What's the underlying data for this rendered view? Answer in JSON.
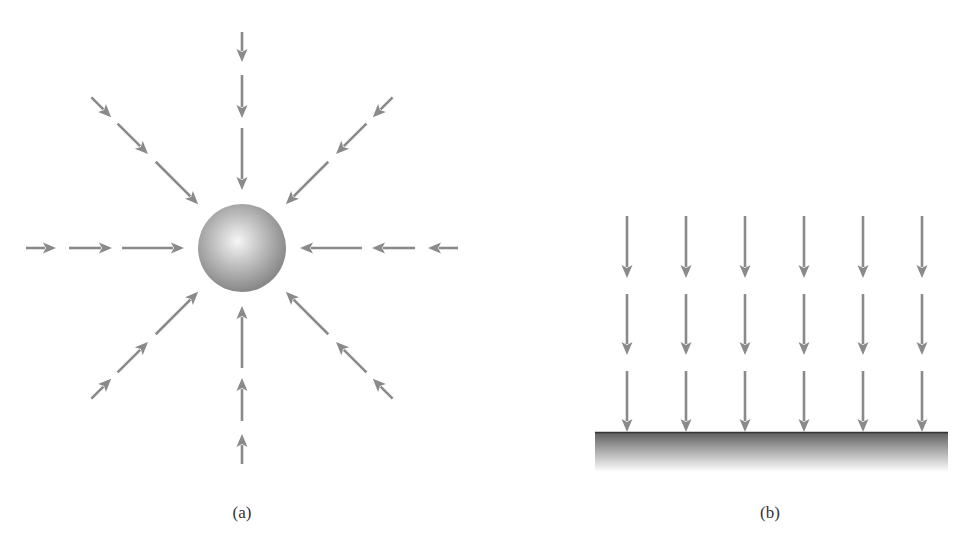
{
  "figure": {
    "panels": [
      {
        "id": "a",
        "label": "(a)",
        "description": "Field lines converging radially on a sphere",
        "sphere": {
          "cx": 242,
          "cy": 248,
          "r": 44
        },
        "directions": 8,
        "segments_per_direction": 3
      },
      {
        "id": "b",
        "label": "(b)",
        "description": "Uniform parallel field lines pointing down onto a flat surface",
        "columns": 6,
        "rows": 3,
        "column_x": [
          627,
          686,
          745,
          804,
          863,
          922
        ],
        "row_y": [
          [
            216,
            278
          ],
          [
            294,
            355
          ],
          [
            371,
            432
          ]
        ],
        "surface": {
          "x": 595,
          "y": 432,
          "width": 353,
          "height": 40
        }
      }
    ],
    "colors": {
      "arrow": "#8a8a8a",
      "sphere_light": "#f4f4f4",
      "sphere_dark": "#7a7a7a",
      "surface_top": "#5a5a5a",
      "surface_bottom": "#ffffff",
      "label": "#333333"
    }
  }
}
